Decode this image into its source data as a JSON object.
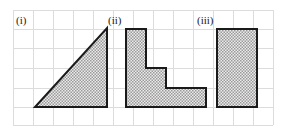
{
  "figure": {
    "background_color": "#ffffff",
    "grid": {
      "name": "square-grid",
      "cell_size_px": 20,
      "line_color": "#d9d9d9",
      "left": 13,
      "top": 10,
      "right": 273,
      "bottom": 125,
      "columns": 13,
      "rows": 6,
      "visible": true
    },
    "style": {
      "outline_color": "#1a1a1a",
      "outline_width_px": 2,
      "fill_pattern": "dotted-hatch",
      "fill_base_color": "#e8e8e8",
      "fill_dot_color": "#808080"
    },
    "baseline_y": 107,
    "shapes": [
      {
        "label": "(i)",
        "name": "right-triangle",
        "type": "polygon",
        "label_x": 16,
        "label_y": 14,
        "points": "35,107 107,107 107,28",
        "description": "right triangle, base 72px (3.6 cells), height 79px (4 cells), right angle at bottom-right",
        "base_cells": 3.6,
        "height_cells": 4
      },
      {
        "label": "(ii)",
        "name": "staircase-l-shape",
        "type": "polygon",
        "label_x": 108,
        "label_y": 14,
        "points": "126,29 146,29 146,68 166,68 166,88 206,88 206,107 126,107",
        "description": "descending staircase / L-shape with two steps",
        "width_cells": 4,
        "height_cells": 4
      },
      {
        "label": "(iii)",
        "name": "rectangle",
        "type": "rect",
        "label_x": 197,
        "label_y": 14,
        "x": 217,
        "y": 29,
        "width": 40,
        "height": 78,
        "description": "upright rectangle, 2 cells wide by 4 cells tall",
        "width_cells": 2,
        "height_cells": 4
      }
    ]
  }
}
